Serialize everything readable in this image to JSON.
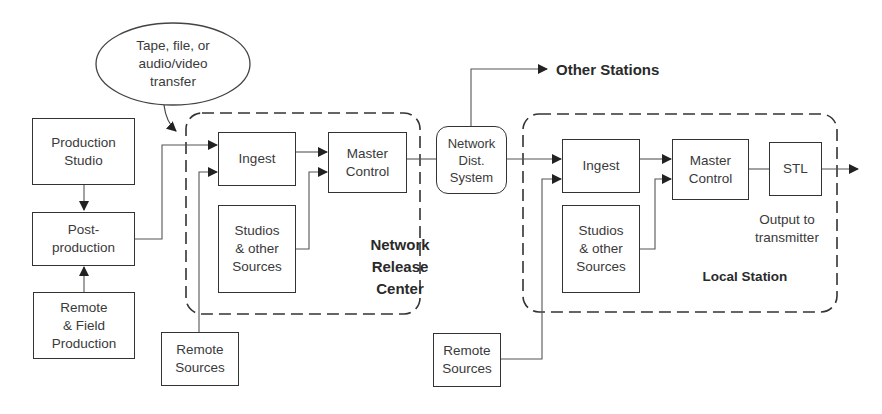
{
  "diagram": {
    "transfer_note": [
      "Tape, file, or",
      "audio/video",
      "transfer"
    ],
    "left": {
      "production_studio": [
        "Production",
        "Studio"
      ],
      "post_production": [
        "Post-",
        "production"
      ],
      "remote_field": [
        "Remote",
        "& Field",
        "Production"
      ],
      "remote_sources": [
        "Remote",
        "Sources"
      ]
    },
    "network_release_center": {
      "label": [
        "Network",
        "Release",
        "Center"
      ],
      "ingest": "Ingest",
      "master_control": [
        "Master",
        "Control"
      ],
      "studios": [
        "Studios",
        "& other",
        "Sources"
      ]
    },
    "network_dist": [
      "Network",
      "Dist.",
      "System"
    ],
    "other_stations": "Other Stations",
    "local_station": {
      "label": "Local Station",
      "ingest": "Ingest",
      "master_control": [
        "Master",
        "Control"
      ],
      "stl": "STL",
      "studios": [
        "Studios",
        "& other",
        "Sources"
      ],
      "output": [
        "Output to",
        "transmitter"
      ],
      "remote_sources": [
        "Remote",
        "Sources"
      ]
    }
  }
}
